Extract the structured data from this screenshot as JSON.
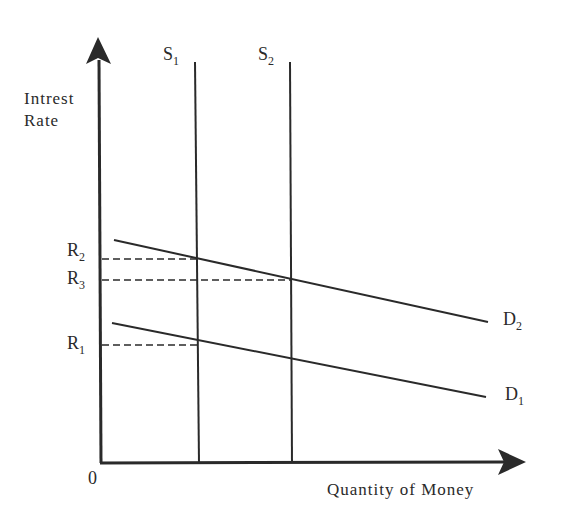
{
  "diagram": {
    "type": "money-market supply-demand",
    "y_axis": {
      "label_line1": "Intrest",
      "label_line2": "Rate"
    },
    "x_axis": {
      "label": "Quantity of Money"
    },
    "origin_label": "0",
    "supply_curves": [
      {
        "name": "S",
        "sub": "1"
      },
      {
        "name": "S",
        "sub": "2"
      }
    ],
    "demand_curves": [
      {
        "name": "D",
        "sub": "2"
      },
      {
        "name": "D",
        "sub": "1"
      }
    ],
    "rate_levels": [
      {
        "name": "R",
        "sub": "2"
      },
      {
        "name": "R",
        "sub": "3"
      },
      {
        "name": "R",
        "sub": "1"
      }
    ],
    "colors": {
      "ink": "#2a2a2a",
      "background": "#ffffff"
    }
  }
}
